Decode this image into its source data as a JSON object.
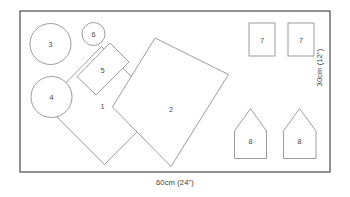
{
  "diagram": {
    "board": {
      "name": "layout-frame",
      "x": 20,
      "y": 11,
      "width": 310,
      "height": 161
    },
    "dimensions": {
      "bottom_label": "60cm (24\")",
      "right_label": "30cm (12\")"
    },
    "stroke_colors": {
      "frame": "#3a3a3a",
      "piece": "#8a8a8a",
      "label_text": "#4a4a4a",
      "dimension_text": "#3c3c3c",
      "background": "#ffffff"
    },
    "pieces": [
      {
        "id": "piece-1",
        "label": "1",
        "shape": "rotated-rectangle",
        "points": "101.5,46.5 161.5,107.0 104.5,164.5 44.5,104.5",
        "label_x": 102.5,
        "label_y": 106.5
      },
      {
        "id": "piece-2",
        "label": "2",
        "shape": "rotated-rectangle",
        "points": "155.0,38.0 228.5,74.5 171.0,166.5 112.5,107.0",
        "label_x": 171.0,
        "label_y": 109.5
      },
      {
        "id": "piece-3",
        "label": "3",
        "shape": "circle",
        "cx": 50.5,
        "cy": 44.0,
        "r": 20.5,
        "label_x": 50.5,
        "label_y": 44.5
      },
      {
        "id": "piece-4",
        "label": "4",
        "shape": "circle",
        "cx": 51.5,
        "cy": 97.0,
        "r": 20.5,
        "label_x": 51.5,
        "label_y": 97.5
      },
      {
        "id": "piece-5",
        "label": "5",
        "shape": "rotated-rectangle",
        "points": "110.0,43.0 129.0,62.0 96.0,95.0 77.0,76.5",
        "label_x": 102.5,
        "label_y": 70.0
      },
      {
        "id": "piece-6",
        "label": "6",
        "shape": "circle",
        "cx": 93.5,
        "cy": 34.0,
        "r": 11.5,
        "label_x": 93.5,
        "label_y": 34.5
      },
      {
        "id": "piece-7-left",
        "label": "7",
        "shape": "rectangle",
        "x": 249.0,
        "y": 23.0,
        "width": 26.0,
        "height": 33.0,
        "label_x": 262.0,
        "label_y": 40.0
      },
      {
        "id": "piece-7-right",
        "label": "7",
        "shape": "rectangle",
        "x": 288.0,
        "y": 23.0,
        "width": 26.0,
        "height": 33.0,
        "label_x": 301.0,
        "label_y": 40.0
      },
      {
        "id": "piece-8-left",
        "label": "8",
        "shape": "house-pentagon",
        "points": "234.5,131.0 234.5,158.5 266.5,158.5 266.5,131.0 250.5,108.5",
        "label_x": 250.5,
        "label_y": 141.5
      },
      {
        "id": "piece-8-right",
        "label": "8",
        "shape": "house-pentagon",
        "points": "283.5,131.0 283.5,158.5 316.0,158.5 316.0,131.0 299.5,108.5",
        "label_x": 299.5,
        "label_y": 141.5
      }
    ]
  }
}
